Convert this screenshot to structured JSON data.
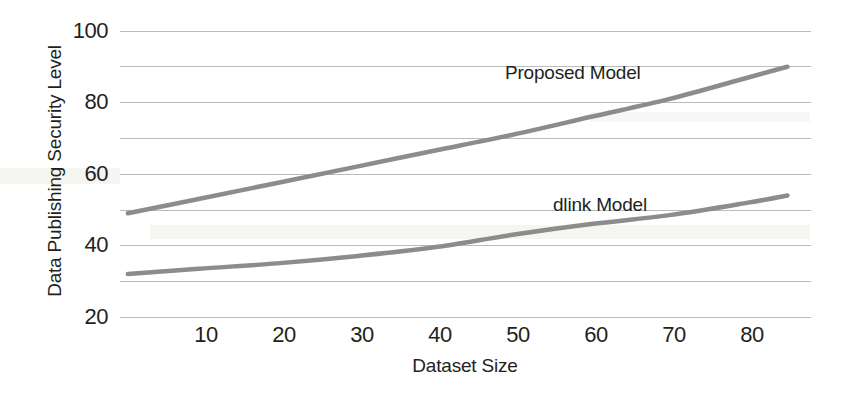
{
  "chart_data": {
    "type": "line",
    "title": "",
    "subtitle": "",
    "xlabel": "Dataset Size",
    "ylabel": "Data Publishing Security Level",
    "xlim": [
      0,
      88
    ],
    "ylim": [
      20,
      100
    ],
    "xticks": [
      10,
      20,
      30,
      40,
      50,
      60,
      70,
      80
    ],
    "yticks": [
      20,
      40,
      60,
      80,
      100
    ],
    "gridlines_y": [
      20,
      30,
      40,
      50,
      60,
      70,
      80,
      90,
      100
    ],
    "grid": true,
    "legend_position": "inline-annotation",
    "x": [
      1,
      10,
      20,
      30,
      40,
      50,
      60,
      70,
      80,
      85
    ],
    "series": [
      {
        "name": "Proposed Model",
        "color": "#8c8c8c",
        "label_x": 50,
        "label_y": 86,
        "values": [
          49,
          53,
          57.5,
          62,
          66.5,
          71,
          76,
          81,
          87,
          90
        ]
      },
      {
        "name": "dlink Model",
        "color": "#8c8c8c",
        "label_x": 55,
        "label_y": 55,
        "values": [
          32,
          33.5,
          35,
          37,
          39.5,
          43,
          46,
          48.5,
          52,
          54
        ]
      }
    ],
    "annotations": [
      {
        "text": "Proposed Model",
        "x": 50,
        "y": 86
      },
      {
        "text": "dlink Model",
        "x": 55,
        "y": 55
      }
    ]
  },
  "axis": {
    "y_title": "Data Publishing Security Level",
    "x_title": "Dataset Size",
    "y_tick_labels": [
      "100",
      "80",
      "60",
      "40",
      "20"
    ],
    "x_tick_labels": [
      "10",
      "20",
      "30",
      "40",
      "50",
      "60",
      "70",
      "80"
    ]
  },
  "series_labels": {
    "proposed": "Proposed Model",
    "dlink": "dlink Model"
  },
  "style": {
    "gridline_color": "#b9bcbe",
    "line_color": "#8c8c8c",
    "text_color": "#231f20",
    "background": "#ffffff"
  }
}
